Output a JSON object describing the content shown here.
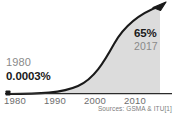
{
  "chart_data": {
    "type": "area",
    "title": "",
    "subtitle": "",
    "xlabel": "",
    "ylabel": "",
    "xlim": [
      1980,
      2017
    ],
    "ylim": [
      0,
      65
    ],
    "grid": false,
    "legend": null,
    "series": [
      {
        "name": "Mobile phone adoption",
        "x": [
          1980,
          1985,
          1990,
          1993,
          1996,
          1999,
          2002,
          2005,
          2008,
          2011,
          2014,
          2017
        ],
        "values": [
          0.0003,
          0.01,
          0.2,
          0.6,
          2,
          6,
          14,
          24,
          37,
          49,
          58,
          65
        ],
        "units": "%"
      }
    ],
    "xticks": [
      {
        "label": "1980",
        "value": 1980
      },
      {
        "label": "1990",
        "value": 1990
      },
      {
        "label": "2000",
        "value": 2000
      },
      {
        "label": "2010",
        "value": 2010
      }
    ],
    "annotations": [
      {
        "name": "start",
        "year": "1980",
        "value": "0.0003%"
      },
      {
        "name": "end",
        "year": "2017",
        "value": "65%"
      }
    ],
    "source": "Sources: GSMA & ITU[1]",
    "colors": {
      "curve": "#1a1a1a",
      "fill": "#dcdcdc",
      "axis": "#2b2b2b",
      "muted_text": "#8a8a8a",
      "bold_text": "#1a1a1a",
      "background": "#ffffff"
    }
  },
  "annotations": {
    "start": {
      "year": "1980",
      "value": "0.0003%"
    },
    "end": {
      "value": "65%",
      "year": "2017"
    }
  },
  "xaxis": {
    "ticks": [
      {
        "label": "1980",
        "left": 4
      },
      {
        "label": "1990",
        "left": 44
      },
      {
        "label": "2000",
        "left": 84
      },
      {
        "label": "2010",
        "left": 124
      }
    ]
  },
  "source": {
    "text": "Sources: GSMA & ITU[1]"
  }
}
